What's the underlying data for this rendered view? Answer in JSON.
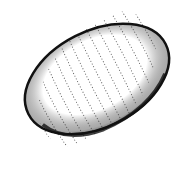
{
  "image": {
    "subject": "stippled ink drawing of an oval egg/cocoon",
    "colors": {
      "background": "#ffffff",
      "ink": "#111111"
    },
    "shape": {
      "cx": 97,
      "cy": 79,
      "rx": 78,
      "ry": 49,
      "rotation": -27
    }
  }
}
